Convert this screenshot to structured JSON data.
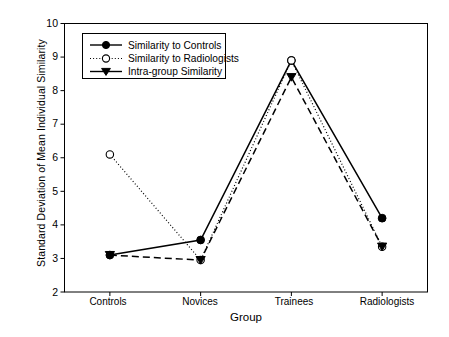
{
  "chart_data": {
    "type": "line",
    "title": "",
    "xlabel": "Group",
    "ylabel": "Standard Deviation of Mean Individual Similarity",
    "categories": [
      "Controls",
      "Novices",
      "Trainees",
      "Radiologists"
    ],
    "ylim": [
      2,
      10
    ],
    "yticks": [
      2,
      3,
      4,
      5,
      6,
      7,
      8,
      9,
      10
    ],
    "ytick_labels": [
      "2",
      "3",
      "4",
      "5",
      "6",
      "7",
      "8",
      "9",
      "10"
    ],
    "grid": false,
    "legend_position": "top-left-inside",
    "series": [
      {
        "name": "Similarity to Controls",
        "values": [
          3.1,
          3.55,
          8.9,
          4.2
        ],
        "marker": "filled-circle",
        "line_style": "solid",
        "color": "#000000"
      },
      {
        "name": "Similarity to Radiologists",
        "values": [
          6.1,
          2.95,
          8.9,
          3.35
        ],
        "marker": "open-circle",
        "line_style": "dotted",
        "color": "#000000"
      },
      {
        "name": "Intra-group Similarity",
        "values": [
          3.1,
          2.95,
          8.4,
          3.35
        ],
        "marker": "filled-triangle-down",
        "line_style": "dashed",
        "color": "#000000"
      }
    ]
  },
  "axes": {
    "y_title": "Standard Deviation of Mean Individual Similarity",
    "x_title": "Group",
    "y_tick_labels": [
      "10",
      "9",
      "8",
      "7",
      "6",
      "5",
      "4",
      "3",
      "2"
    ],
    "x_tick_labels": [
      "Controls",
      "Novices",
      "Trainees",
      "Radiologists"
    ]
  },
  "legend": {
    "items": [
      {
        "label": "Similarity to Controls"
      },
      {
        "label": "Similarity to Radiologists"
      },
      {
        "label": "Intra-group Similarity"
      }
    ]
  }
}
